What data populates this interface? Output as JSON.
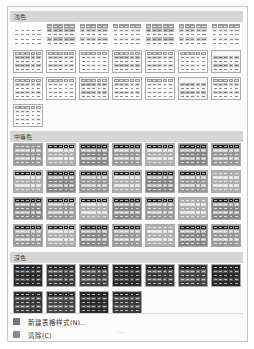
{
  "gallery": {
    "sections": [
      {
        "title": "浅色",
        "rows": [
          7,
          7,
          7,
          1
        ],
        "tone": "light"
      },
      {
        "title": "中等色",
        "rows": [
          7,
          7,
          7,
          7
        ],
        "tone": "medium"
      },
      {
        "title": "深色",
        "rows": [
          7,
          4
        ],
        "tone": "dark"
      }
    ]
  },
  "menu": {
    "new_style": "新建表格样式(N)...",
    "clear": "清除(C)"
  },
  "grip": "....",
  "colors": {
    "header_band": "#d6d6d6",
    "border": "#c8c8c8"
  }
}
